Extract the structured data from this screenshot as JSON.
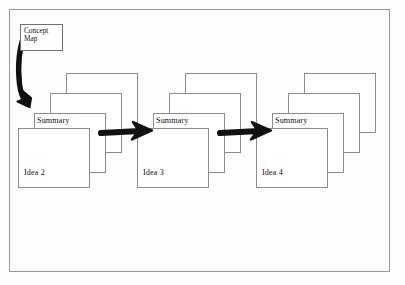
{
  "diagram": {
    "title_note": "Concept map to linked idea-summary card stacks",
    "background_color": "#fdfdfd",
    "frame_border_color": "#9a9a9a",
    "card_border_color": "#8c8c8c",
    "card_fill_color": "#ffffff",
    "arrow_color": "#111111"
  },
  "concept_map": {
    "line1": "Concept",
    "line2": "Map"
  },
  "stacks": [
    {
      "id": "stack-idea-2",
      "summary_label": "Summary",
      "idea_label": "Idea 2"
    },
    {
      "id": "stack-idea-3",
      "summary_label": "Summary",
      "idea_label": "Idea 3"
    },
    {
      "id": "stack-idea-4",
      "summary_label": "Summary",
      "idea_label": "Idea 4"
    }
  ],
  "arrows": [
    {
      "id": "arrow-concept-to-stack1",
      "kind": "curved-down",
      "color": "#111111"
    },
    {
      "id": "arrow-stack1-to-stack2",
      "kind": "straight-right",
      "color": "#111111"
    },
    {
      "id": "arrow-stack2-to-stack3",
      "kind": "straight-right",
      "color": "#111111"
    }
  ]
}
